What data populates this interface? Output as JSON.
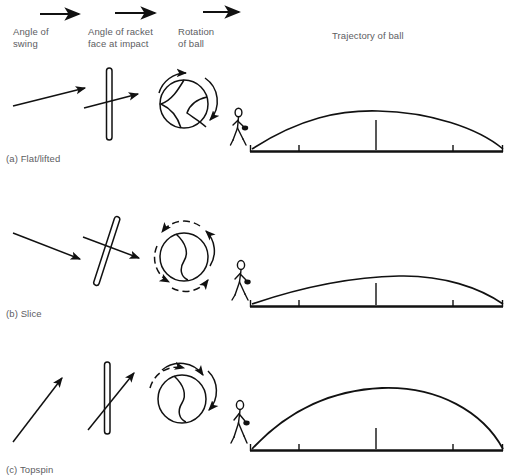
{
  "figure": {
    "background_color": "#ffffff",
    "ink_color": "#1a1a1a",
    "text_color": "#5d5d5f"
  },
  "headers": {
    "arrows": [
      {
        "name": "swing-direction-arrow"
      },
      {
        "name": "racket-face-direction-arrow"
      },
      {
        "name": "rotation-direction-arrow"
      }
    ],
    "columns": [
      {
        "id": "swing",
        "label": "Angle of\nswing"
      },
      {
        "id": "racket",
        "label": "Angle of racket\nface at impact"
      },
      {
        "id": "rotation",
        "label": "Rotation\nof ball"
      },
      {
        "id": "trajectory",
        "label": "Trajectory of ball"
      }
    ]
  },
  "rows": [
    {
      "id": "a",
      "caption": "(a) Flat/lifted",
      "swing_angle_deg": -13,
      "racket_tilt_deg": 0,
      "racket_face": "vertical",
      "impact_arrow_deg": -13,
      "spin": "topspin",
      "spin_direction": "clockwise",
      "spin_amount": "light",
      "seam_style": "curved-seam",
      "trajectory": {
        "peak_height": 38,
        "peak_position": 0.46,
        "shape": "shallow-arc"
      }
    },
    {
      "id": "b",
      "caption": "(b) Slice",
      "swing_angle_deg": 20,
      "racket_tilt_deg": 18,
      "racket_face": "open",
      "impact_arrow_deg": 20,
      "spin": "backspin",
      "spin_direction": "counter-clockwise",
      "spin_amount": "heavy",
      "seam_style": "s-seam",
      "trajectory": {
        "peak_height": 30,
        "peak_position": 0.58,
        "shape": "flat-long-arc"
      }
    },
    {
      "id": "c",
      "caption": "(c) Topspin",
      "swing_angle_deg": -42,
      "racket_tilt_deg": 0,
      "racket_face": "vertical",
      "impact_arrow_deg": -42,
      "spin": "topspin",
      "spin_direction": "clockwise",
      "spin_amount": "heavy",
      "seam_style": "s-seam",
      "trajectory": {
        "peak_height": 62,
        "peak_position": 0.47,
        "shape": "high-steep-arc"
      }
    }
  ],
  "court": {
    "baseline_label": "court-baseline",
    "net_label": "net-post",
    "tick_positions": [
      0,
      0.19,
      0.55,
      1
    ],
    "player_label": "player-figure"
  }
}
